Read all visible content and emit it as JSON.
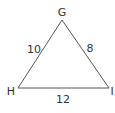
{
  "diagram": {
    "type": "triangle",
    "vertices": [
      {
        "label": "G",
        "x": 62,
        "y": 20
      },
      {
        "label": "H",
        "x": 18,
        "y": 88
      },
      {
        "label": "I",
        "x": 109,
        "y": 88
      }
    ],
    "sides": [
      {
        "between": "G-H",
        "length_label": "10"
      },
      {
        "between": "G-I",
        "length_label": "8"
      },
      {
        "between": "H-I",
        "length_label": "12"
      }
    ],
    "stroke_color": "#555555",
    "text_color": "#333333"
  }
}
